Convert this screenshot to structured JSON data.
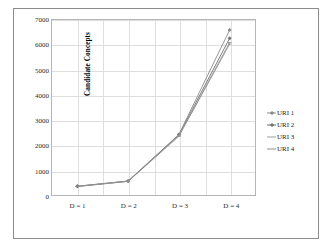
{
  "chart_data": {
    "type": "line",
    "title": "",
    "xlabel": "",
    "ylabel": "Candidate Concepts",
    "categories": [
      "D = 1",
      "D = 2",
      "D = 3",
      "D = 4"
    ],
    "ylim": [
      0,
      7000
    ],
    "ytick_labels": [
      "0",
      "1000",
      "2000",
      "3000",
      "4000",
      "5000",
      "6000",
      "7000"
    ],
    "ytick_values": [
      0,
      1000,
      2000,
      3000,
      4000,
      5000,
      6000,
      7000
    ],
    "grid": "both",
    "legend_position": "right",
    "series": [
      {
        "name": "URI 1",
        "values": [
          350,
          560,
          2420,
          6600
        ],
        "color": "#8a8a8a",
        "marker": "diamond"
      },
      {
        "name": "URI 2",
        "values": [
          350,
          555,
          2400,
          6270
        ],
        "color": "#6f6f6f",
        "marker": "diamond"
      },
      {
        "name": "URI 3",
        "values": [
          345,
          550,
          2380,
          6100
        ],
        "color": "#9d9d9d",
        "marker": "dash"
      },
      {
        "name": "URI 4",
        "values": [
          340,
          545,
          2350,
          6040
        ],
        "color": "#8f8f8f",
        "marker": "dash"
      }
    ]
  }
}
